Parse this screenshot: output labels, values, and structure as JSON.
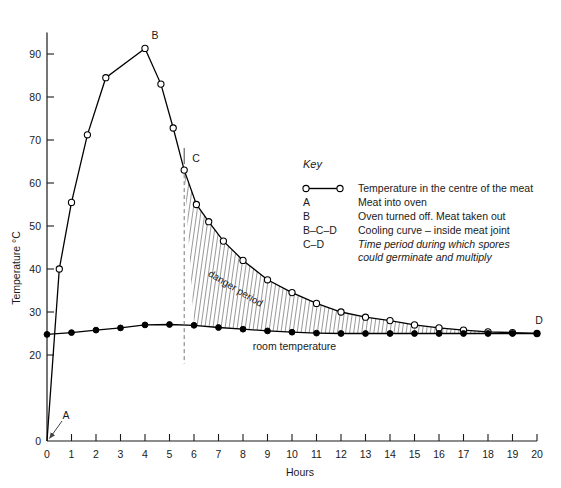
{
  "chart_data": {
    "type": "line",
    "title": "",
    "xlabel": "Hours",
    "ylabel": "Temperature °C",
    "xlim": [
      0,
      20
    ],
    "ylim": [
      0,
      95
    ],
    "grid": false,
    "xticks": [
      "0",
      "1",
      "2",
      "3",
      "4",
      "5",
      "6",
      "7",
      "8",
      "9",
      "10",
      "11",
      "12",
      "13",
      "14",
      "15",
      "16",
      "17",
      "18",
      "19",
      "20"
    ],
    "yticks": [
      "0",
      "20",
      "30",
      "40",
      "50",
      "60",
      "70",
      "80",
      "90"
    ],
    "series": [
      {
        "name": "Temperature in the centre of the meat",
        "marker": "open-circle",
        "x": [
          0,
          0.5,
          1,
          1.65,
          2.4,
          4,
          4.65,
          5.15,
          5.6,
          6.1,
          6.6,
          7.2,
          8,
          9,
          10,
          11,
          12,
          13,
          14,
          15,
          16,
          17,
          18,
          19,
          20
        ],
        "y": [
          0,
          40,
          55.5,
          71.2,
          84.5,
          91.3,
          83,
          72.8,
          63,
          55,
          51,
          46.5,
          42,
          37.5,
          34.5,
          32,
          30,
          28.8,
          28,
          27,
          26.3,
          25.8,
          25.4,
          25.2,
          25
        ]
      },
      {
        "name": "room temperature",
        "marker": "solid-circle",
        "x": [
          0,
          1,
          2,
          3,
          4,
          5,
          6,
          7,
          8,
          9,
          10,
          11,
          12,
          13,
          14,
          15,
          16,
          17,
          18,
          19,
          20
        ],
        "y": [
          24.8,
          25.2,
          25.8,
          26.3,
          27,
          27.1,
          26.9,
          26.4,
          26,
          25.6,
          25.3,
          25.1,
          25,
          25,
          25,
          25,
          25,
          25,
          25,
          25,
          25
        ]
      }
    ],
    "annotations": [
      {
        "label": "A",
        "x": 0,
        "y": 0,
        "note": "Meat into oven"
      },
      {
        "label": "B",
        "x": 4,
        "y": 91.3,
        "note": "Oven turned off. Meat taken out"
      },
      {
        "label": "C",
        "x": 5.6,
        "y": 63,
        "note": "start of danger period"
      },
      {
        "label": "D",
        "x": 20,
        "y": 25,
        "note": "end of danger period"
      }
    ],
    "region_labels": [
      {
        "text": "danger period",
        "between": [
          "Temperature in the centre of the meat",
          "room temperature"
        ],
        "from_x": 5.6,
        "to_x": 20
      }
    ],
    "inline_labels": [
      {
        "text": "room temperature"
      }
    ]
  },
  "key": {
    "title": "Key",
    "entries": [
      {
        "code": "",
        "symbol": "open-circle-line",
        "desc": "Temperature in the centre of the meat",
        "italic": false
      },
      {
        "code": "A",
        "symbol": "",
        "desc": "Meat into oven",
        "italic": false
      },
      {
        "code": "B",
        "symbol": "",
        "desc": "Oven turned off. Meat taken out",
        "italic": false
      },
      {
        "code": "B–C–D",
        "symbol": "",
        "desc": "Cooling curve – inside meat joint",
        "italic": false
      },
      {
        "code": "C–D",
        "symbol": "",
        "desc": "Time period during which spores",
        "desc2": "could germinate and multiply",
        "italic": true
      }
    ]
  },
  "colors": {
    "ink": "#1a1a1a",
    "curve": "#000000",
    "background": "#ffffff",
    "dashed": "#777777"
  }
}
